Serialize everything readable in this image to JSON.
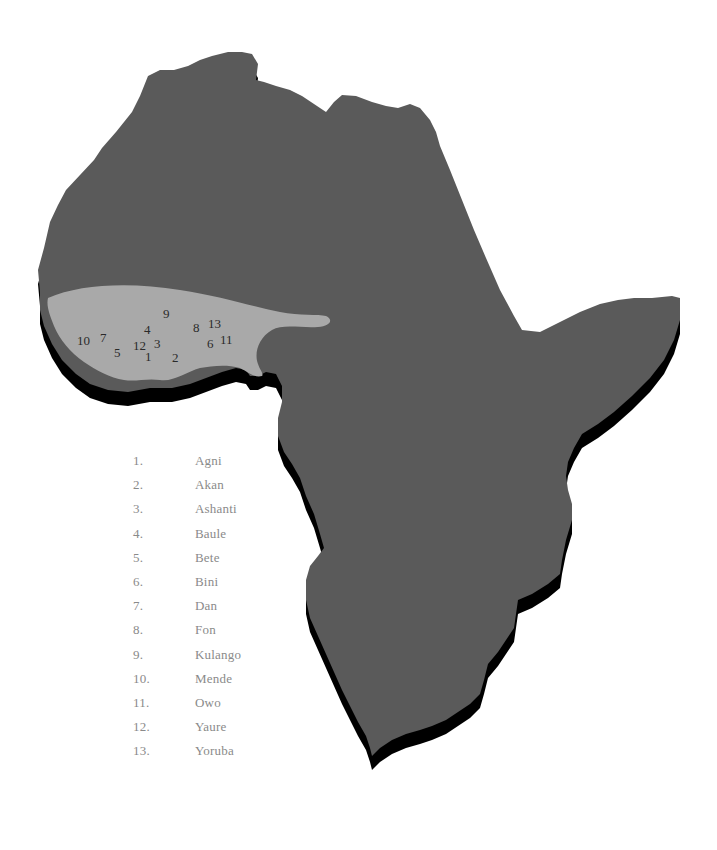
{
  "map": {
    "colors": {
      "continent": "#5a5a5a",
      "shadow": "#000000",
      "region_highlight": "#a9a9a9",
      "label_text": "#2a2a2a",
      "legend_text": "#8a8a8a",
      "background": "#ffffff"
    },
    "region_labels": [
      {
        "id": "1",
        "text": "1",
        "x": 148,
        "y": 361
      },
      {
        "id": "2",
        "text": "2",
        "x": 175,
        "y": 362
      },
      {
        "id": "3",
        "text": "3",
        "x": 158,
        "y": 348
      },
      {
        "id": "4",
        "text": "4",
        "x": 148,
        "y": 333
      },
      {
        "id": "5",
        "text": "5",
        "x": 118,
        "y": 356
      },
      {
        "id": "6",
        "text": "6",
        "x": 211,
        "y": 347
      },
      {
        "id": "7",
        "text": "7",
        "x": 104,
        "y": 341
      },
      {
        "id": "8",
        "text": "8",
        "x": 197,
        "y": 331
      },
      {
        "id": "9",
        "text": "9",
        "x": 166,
        "y": 317
      },
      {
        "id": "10",
        "text": "10",
        "x": 77,
        "y": 344
      },
      {
        "id": "11",
        "text": "11",
        "x": 221,
        "y": 344
      },
      {
        "id": "12",
        "text": "12",
        "x": 134,
        "y": 350
      },
      {
        "id": "13",
        "text": "13",
        "x": 208,
        "y": 327
      }
    ]
  },
  "legend": {
    "items": [
      {
        "number": "1.",
        "name": "Agni"
      },
      {
        "number": "2.",
        "name": "Akan"
      },
      {
        "number": "3.",
        "name": "Ashanti"
      },
      {
        "number": "4.",
        "name": "Baule"
      },
      {
        "number": "5.",
        "name": "Bete"
      },
      {
        "number": "6.",
        "name": "Bini"
      },
      {
        "number": "7.",
        "name": "Dan"
      },
      {
        "number": "8.",
        "name": "Fon"
      },
      {
        "number": "9.",
        "name": "Kulango"
      },
      {
        "number": "10.",
        "name": "Mende"
      },
      {
        "number": "11.",
        "name": "Owo"
      },
      {
        "number": "12.",
        "name": "Yaure"
      },
      {
        "number": "13.",
        "name": "Yoruba"
      }
    ]
  }
}
